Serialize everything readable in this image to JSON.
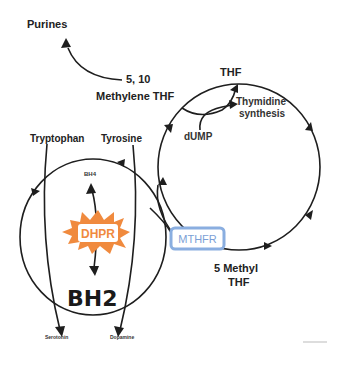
{
  "diagram": {
    "labels": {
      "purines": "Purines",
      "methylene_thf_line1": "5, 10",
      "methylene_thf_line2": "Methylene THF",
      "thf": "THF",
      "thymidine_line1": "Thymidine",
      "thymidine_line2": "synthesis",
      "dump": "dUMP",
      "tryptophan": "Tryptophan",
      "tyrosine": "Tyrosine",
      "bh4": "BH4",
      "bh2": "BH2",
      "serotonin": "Serotonin",
      "dopamine": "Dopamine",
      "methyl_thf_line1": "5 Methyl",
      "methyl_thf_line2": "THF"
    },
    "enzymes": {
      "dhpr": {
        "label": "DHPR",
        "color": "#F08A3E"
      },
      "mthfr": {
        "label": "MTHFR",
        "color": "#7FA3DA"
      }
    },
    "colors": {
      "line": "#1e1e1e",
      "text": "#222222"
    }
  }
}
